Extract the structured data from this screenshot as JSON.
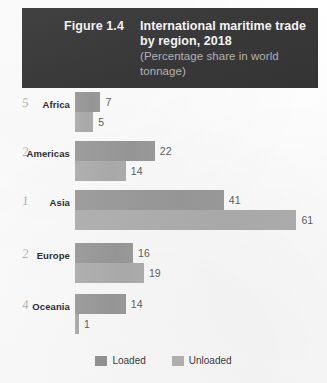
{
  "header": {
    "figure_number": "Figure 1.4",
    "title": "International maritime trade by region, 2018",
    "subtitle": "(Percentage share in world tonnage)",
    "background_color": "#3a3a3a",
    "title_color": "#f4f4f4",
    "subtitle_color": "#b2b2b2"
  },
  "legend": {
    "items": [
      {
        "label": "Loaded",
        "color": "#909090"
      },
      {
        "label": "Unloaded",
        "color": "#aeaeae"
      }
    ]
  },
  "annotations": {
    "note": "handwritten pencil marks in left margin",
    "marks": [
      "5",
      "2",
      "1",
      "2",
      "4"
    ]
  },
  "chart_data": {
    "type": "bar",
    "orientation": "horizontal",
    "title": "International maritime trade by region, 2018",
    "subtitle": "(Percentage share in world tonnage)",
    "xlabel": "",
    "ylabel": "",
    "xlim": [
      0,
      61
    ],
    "grid": false,
    "legend_position": "bottom-center",
    "value_suffix": "",
    "categories": [
      "Africa",
      "Americas",
      "Asia",
      "Europe",
      "Oceania"
    ],
    "series": [
      {
        "name": "Loaded",
        "color": "#9a9a9a",
        "values": [
          7,
          22,
          41,
          16,
          14
        ]
      },
      {
        "name": "Unloaded",
        "color": "#acacac",
        "values": [
          5,
          14,
          61,
          19,
          1
        ]
      }
    ]
  }
}
